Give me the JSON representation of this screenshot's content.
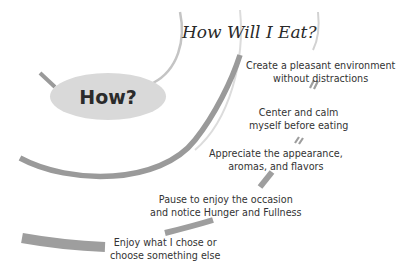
{
  "title": "How Will I Eat?",
  "hub": {
    "label": "How?",
    "color": "#d9d9d9"
  },
  "steps": [
    {
      "line1": "Create a pleasant environment",
      "line2": "without distractions"
    },
    {
      "line1": "Center and calm",
      "line2": "myself before eating"
    },
    {
      "line1": "Appreciate the appearance,",
      "line2": "aromas, and flavors"
    },
    {
      "line1": "Pause to enjoy the occasion",
      "line2": "and notice Hunger and Fullness"
    },
    {
      "line1": "Enjoy what I chose or",
      "line2": "choose something else"
    }
  ],
  "colors": {
    "arc": "#9a9a9a",
    "arc_light": "#c8c8c8",
    "text": "#333333"
  }
}
